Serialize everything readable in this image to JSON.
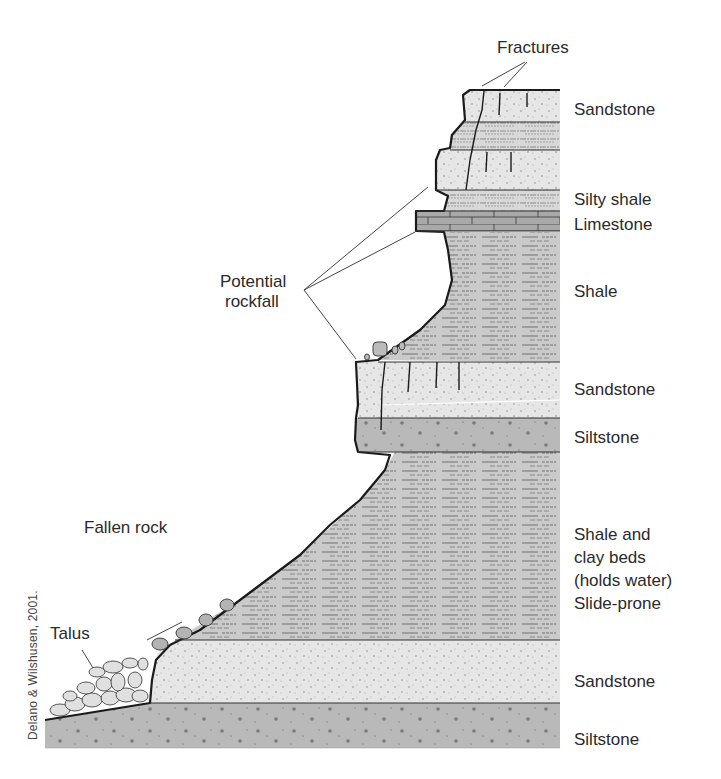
{
  "labels": {
    "fractures": "Fractures",
    "potential_rockfall_1": "Potential",
    "potential_rockfall_2": "rockfall",
    "fallen_rock": "Fallen rock",
    "talus": "Talus"
  },
  "layers": [
    {
      "name": "Sandstone",
      "lines": [
        "Sandstone"
      ]
    },
    {
      "name": "Silty shale",
      "lines": [
        "Silty shale"
      ]
    },
    {
      "name": "Limestone",
      "lines": [
        "Limestone"
      ]
    },
    {
      "name": "Shale",
      "lines": [
        "Shale"
      ]
    },
    {
      "name": "Sandstone",
      "lines": [
        "Sandstone"
      ]
    },
    {
      "name": "Siltstone",
      "lines": [
        "Siltstone"
      ]
    },
    {
      "name": "Shale and clay beds",
      "lines": [
        "Shale and",
        "clay beds",
        "(holds water)",
        "Slide-prone"
      ]
    },
    {
      "name": "Sandstone",
      "lines": [
        "Sandstone"
      ]
    },
    {
      "name": "Siltstone",
      "lines": [
        "Siltstone"
      ]
    }
  ],
  "credit": "Delano & Wilshusen, 2001.",
  "colors": {
    "sandstone": "#e4e4e4",
    "shale": "#c8c8c8",
    "siltstone": "#b8b8b8",
    "limestone": "#a8a8a8",
    "outline": "#1a1a1a"
  }
}
